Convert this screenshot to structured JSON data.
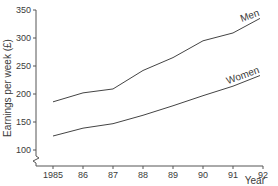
{
  "chart_data": {
    "type": "line",
    "title": "",
    "xlabel": "Year",
    "ylabel": "Earnings per week (£)",
    "x": [
      "1985",
      "86",
      "87",
      "88",
      "89",
      "90",
      "91",
      "92"
    ],
    "x_numeric": [
      1985,
      1986,
      1987,
      1988,
      1989,
      1990,
      1991,
      1992
    ],
    "ylim": [
      100,
      350
    ],
    "yticks": [
      100,
      150,
      200,
      250,
      300,
      350
    ],
    "axis_break": "y-axis broken below 100",
    "grid": false,
    "legend": "inline labels at line ends",
    "series": [
      {
        "name": "Men",
        "x": [
          1985,
          1986,
          1987,
          1988,
          1989,
          1990,
          1991,
          1991.9
        ],
        "values": [
          186,
          202,
          209,
          242,
          265,
          295,
          309,
          335
        ]
      },
      {
        "name": "Women",
        "x": [
          1985,
          1986,
          1987,
          1988,
          1989,
          1990,
          1991,
          1991.9
        ],
        "values": [
          125,
          139,
          147,
          162,
          179,
          197,
          214,
          233
        ]
      }
    ]
  },
  "axes": {
    "y_title": "Earnings per week (£)",
    "x_title": "Year",
    "y_tick_labels": [
      "100",
      "150",
      "200",
      "250",
      "300",
      "350"
    ],
    "x_tick_labels": [
      "1985",
      "86",
      "87",
      "88",
      "89",
      "90",
      "91",
      "92"
    ]
  },
  "labels": {
    "men": "Men",
    "women": "Women"
  },
  "colors": {
    "line": "#444444",
    "axis": "#555555",
    "text": "#3a3a3a"
  }
}
